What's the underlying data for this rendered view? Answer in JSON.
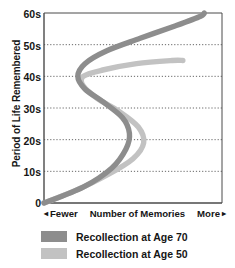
{
  "chart_data": {
    "type": "line",
    "title": "",
    "xlabel": "Number of Memories",
    "xlabel_left": "Fewer",
    "xlabel_right": "More",
    "ylabel": "Period of Life Remembered",
    "yticks": [
      "60s",
      "50s",
      "40s",
      "30s",
      "20s",
      "10s",
      "0"
    ],
    "ytick_values": [
      60,
      50,
      40,
      30,
      20,
      10,
      0
    ],
    "ylim": [
      0,
      60
    ],
    "xlim": [
      0,
      100
    ],
    "grid": true,
    "grid_lines_at": [
      50,
      40,
      30,
      20,
      10
    ],
    "legend_position": "below",
    "x_axis_units": "relative number of memories (unlabeled)",
    "series": [
      {
        "name": "Recollection at Age 70",
        "color": "#8d8d8d",
        "points": [
          {
            "x": 0,
            "y": 0
          },
          {
            "x": 22,
            "y": 5
          },
          {
            "x": 38,
            "y": 11
          },
          {
            "x": 46,
            "y": 17
          },
          {
            "x": 48,
            "y": 22
          },
          {
            "x": 44,
            "y": 27
          },
          {
            "x": 33,
            "y": 32
          },
          {
            "x": 23,
            "y": 36
          },
          {
            "x": 19,
            "y": 40
          },
          {
            "x": 23,
            "y": 44
          },
          {
            "x": 35,
            "y": 48
          },
          {
            "x": 54,
            "y": 52
          },
          {
            "x": 74,
            "y": 56
          },
          {
            "x": 88,
            "y": 59
          },
          {
            "x": 90,
            "y": 60
          }
        ]
      },
      {
        "name": "Recollection at Age 50",
        "color": "#c2c2c2",
        "points": [
          {
            "x": 0,
            "y": 0
          },
          {
            "x": 18,
            "y": 4
          },
          {
            "x": 36,
            "y": 9
          },
          {
            "x": 50,
            "y": 14
          },
          {
            "x": 56,
            "y": 19
          },
          {
            "x": 53,
            "y": 24
          },
          {
            "x": 42,
            "y": 29
          },
          {
            "x": 30,
            "y": 33
          },
          {
            "x": 22,
            "y": 37
          },
          {
            "x": 22,
            "y": 40
          },
          {
            "x": 33,
            "y": 42
          },
          {
            "x": 52,
            "y": 44
          },
          {
            "x": 72,
            "y": 45
          },
          {
            "x": 78,
            "y": 45
          }
        ]
      }
    ]
  },
  "axis": {
    "y_label": "Period of Life Remembered",
    "ticks": [
      {
        "label": "60s"
      },
      {
        "label": "50s"
      },
      {
        "label": "40s"
      },
      {
        "label": "30s"
      },
      {
        "label": "20s"
      },
      {
        "label": "10s"
      },
      {
        "label": "0"
      }
    ],
    "x_left_marker": "◂",
    "x_left_label": "Fewer",
    "x_center_label": "Number of Memories",
    "x_right_label": "More",
    "x_right_marker": "▸"
  },
  "legend": {
    "items": [
      {
        "label": "Recollection at Age 70",
        "color": "#8d8d8d"
      },
      {
        "label": "Recollection at Age 50",
        "color": "#c2c2c2"
      }
    ]
  },
  "colors": {
    "series_age_70": "#8d8d8d",
    "series_age_50": "#c2c2c2",
    "axis": "#4a4a4a",
    "grid": "#555555",
    "text": "#161616",
    "background": "#ffffff"
  }
}
